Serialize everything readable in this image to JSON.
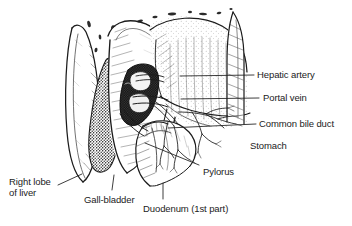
{
  "figure": {
    "background_color": "#ffffff",
    "ink_color": "#1b1b1b",
    "label_color": "#1b1b1b"
  },
  "labels": [
    {
      "id": "hepatic-artery",
      "text": "Hepatic artery",
      "x": 257,
      "y": 69,
      "leader": {
        "type": "line",
        "x1": 180,
        "y1": 76,
        "x2": 254,
        "y2": 75
      }
    },
    {
      "id": "portal-vein",
      "text": "Portal vein",
      "x": 263,
      "y": 92,
      "leader": {
        "type": "line",
        "x1": 181,
        "y1": 99,
        "x2": 259,
        "y2": 98
      }
    },
    {
      "id": "common-bile-duct",
      "text": "Common bile duct",
      "x": 259,
      "y": 118,
      "leader": {
        "type": "line",
        "x1": 168,
        "y1": 128,
        "x2": 256,
        "y2": 124
      }
    },
    {
      "id": "stomach",
      "text": "Stomach",
      "x": 250,
      "y": 140,
      "leader": null
    },
    {
      "id": "pylorus",
      "text": "Pylorus",
      "x": 203,
      "y": 166,
      "leader": {
        "type": "line",
        "x1": 145,
        "y1": 143,
        "x2": 199,
        "y2": 165
      }
    },
    {
      "id": "duodenum-1st-part",
      "text": "Duodenum (1st part)",
      "x": 143,
      "y": 203,
      "leader": {
        "type": "line",
        "x1": 163,
        "y1": 183,
        "x2": 163,
        "y2": 199
      }
    },
    {
      "id": "gall-bladder",
      "text": "Gall-bladder",
      "x": 84,
      "y": 194,
      "leader": {
        "type": "line",
        "x1": 114,
        "y1": 175,
        "x2": 112,
        "y2": 190
      }
    },
    {
      "id": "right-lobe-of-liver",
      "text": "Right lobe\nof liver",
      "x": 9,
      "y": 176,
      "leader": {
        "type": "line",
        "x1": 58,
        "y1": 185,
        "x2": 82,
        "y2": 174
      }
    }
  ]
}
